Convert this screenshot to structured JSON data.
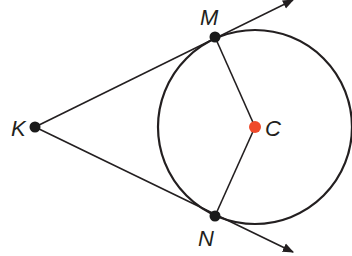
{
  "diagram": {
    "type": "geometry",
    "points": {
      "K": {
        "label": "K",
        "x": 35,
        "y": 127
      },
      "M": {
        "label": "M",
        "x": 215,
        "y": 37
      },
      "N": {
        "label": "N",
        "x": 215,
        "y": 216
      },
      "C": {
        "label": "C",
        "x": 255,
        "y": 127
      }
    },
    "circle": {
      "center": "C",
      "cx": 255,
      "cy": 127,
      "r": 97
    },
    "segments": [
      [
        "C",
        "M"
      ],
      [
        "C",
        "N"
      ]
    ],
    "rays": [
      {
        "from": "K",
        "through": "M"
      },
      {
        "from": "K",
        "through": "N"
      }
    ],
    "colors": {
      "stroke": "#231f20",
      "point": "#1a1a1a",
      "center": "#ef4a2b"
    }
  }
}
